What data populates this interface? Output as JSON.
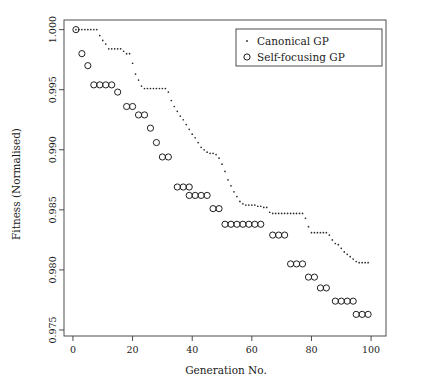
{
  "figure": {
    "width": 421,
    "height": 391,
    "background": "#ffffff",
    "foreground": "#1a1a1a"
  },
  "chart_data": {
    "type": "scatter",
    "title": "",
    "xlabel": "Generation No.",
    "ylabel": "Fitness (Normalised)",
    "xlim": [
      -3,
      105
    ],
    "ylim": [
      0.9745,
      1.0008
    ],
    "xticks": [
      0,
      20,
      40,
      60,
      80,
      100
    ],
    "xticklabels": [
      "0",
      "20",
      "40",
      "60",
      "80",
      "100"
    ],
    "yticks": [
      0.975,
      0.98,
      0.985,
      0.99,
      0.995,
      1.0
    ],
    "yticklabels": [
      "0.975",
      "0.980",
      "0.985",
      "0.990",
      "0.995",
      "1.000"
    ],
    "grid": false,
    "legend_position": "top-right",
    "series": [
      {
        "name": "Canonical GP",
        "marker": "dot",
        "color": "#2b2b2b",
        "points": [
          [
            1,
            1.0
          ],
          [
            2,
            1.0
          ],
          [
            3,
            1.0
          ],
          [
            4,
            1.0
          ],
          [
            5,
            1.0
          ],
          [
            6,
            1.0
          ],
          [
            7,
            1.0
          ],
          [
            8,
            1.0
          ],
          [
            9,
            0.9995
          ],
          [
            10,
            0.9991
          ],
          [
            11,
            0.9988
          ],
          [
            12,
            0.9984
          ],
          [
            13,
            0.9984
          ],
          [
            14,
            0.9984
          ],
          [
            15,
            0.9984
          ],
          [
            16,
            0.9984
          ],
          [
            17,
            0.9982
          ],
          [
            18,
            0.998
          ],
          [
            19,
            0.998
          ],
          [
            20,
            0.9972
          ],
          [
            21,
            0.9963
          ],
          [
            22,
            0.9958
          ],
          [
            23,
            0.9953
          ],
          [
            24,
            0.9951
          ],
          [
            25,
            0.9951
          ],
          [
            26,
            0.9951
          ],
          [
            27,
            0.9951
          ],
          [
            28,
            0.9951
          ],
          [
            29,
            0.9951
          ],
          [
            30,
            0.9951
          ],
          [
            31,
            0.9951
          ],
          [
            32,
            0.9948
          ],
          [
            33,
            0.9941
          ],
          [
            34,
            0.9936
          ],
          [
            35,
            0.9932
          ],
          [
            36,
            0.9928
          ],
          [
            37,
            0.9925
          ],
          [
            38,
            0.9921
          ],
          [
            39,
            0.9917
          ],
          [
            40,
            0.9913
          ],
          [
            41,
            0.991
          ],
          [
            42,
            0.9906
          ],
          [
            43,
            0.9902
          ],
          [
            44,
            0.99
          ],
          [
            45,
            0.9898
          ],
          [
            46,
            0.9897
          ],
          [
            47,
            0.9897
          ],
          [
            48,
            0.9896
          ],
          [
            49,
            0.9893
          ],
          [
            50,
            0.9888
          ],
          [
            51,
            0.9882
          ],
          [
            52,
            0.9875
          ],
          [
            53,
            0.987
          ],
          [
            54,
            0.9865
          ],
          [
            55,
            0.9861
          ],
          [
            56,
            0.9857
          ],
          [
            57,
            0.9855
          ],
          [
            58,
            0.9854
          ],
          [
            59,
            0.9854
          ],
          [
            60,
            0.9854
          ],
          [
            61,
            0.9854
          ],
          [
            62,
            0.9853
          ],
          [
            63,
            0.9853
          ],
          [
            64,
            0.9852
          ],
          [
            65,
            0.9852
          ],
          [
            66,
            0.9848
          ],
          [
            67,
            0.9847
          ],
          [
            68,
            0.9847
          ],
          [
            69,
            0.9847
          ],
          [
            70,
            0.9847
          ],
          [
            71,
            0.9847
          ],
          [
            72,
            0.9847
          ],
          [
            73,
            0.9847
          ],
          [
            74,
            0.9847
          ],
          [
            75,
            0.9847
          ],
          [
            76,
            0.9847
          ],
          [
            77,
            0.9847
          ],
          [
            78,
            0.9843
          ],
          [
            79,
            0.9836
          ],
          [
            80,
            0.9831
          ],
          [
            81,
            0.9831
          ],
          [
            82,
            0.9831
          ],
          [
            83,
            0.9831
          ],
          [
            84,
            0.9831
          ],
          [
            85,
            0.9831
          ],
          [
            86,
            0.9829
          ],
          [
            87,
            0.9825
          ],
          [
            88,
            0.9822
          ],
          [
            89,
            0.9821
          ],
          [
            90,
            0.9818
          ],
          [
            91,
            0.9815
          ],
          [
            92,
            0.9813
          ],
          [
            93,
            0.9811
          ],
          [
            94,
            0.9809
          ],
          [
            95,
            0.9807
          ],
          [
            96,
            0.9806
          ],
          [
            97,
            0.9806
          ],
          [
            98,
            0.9806
          ],
          [
            99,
            0.9806
          ]
        ]
      },
      {
        "name": "Self-focusing GP",
        "marker": "circle",
        "color": "#1f1f1f",
        "points": [
          [
            1,
            1.0
          ],
          [
            3,
            0.998
          ],
          [
            5,
            0.997
          ],
          [
            7,
            0.9954
          ],
          [
            9,
            0.9954
          ],
          [
            11,
            0.9954
          ],
          [
            13,
            0.9954
          ],
          [
            15,
            0.9948
          ],
          [
            18,
            0.9936
          ],
          [
            20,
            0.9936
          ],
          [
            22,
            0.9929
          ],
          [
            24,
            0.9929
          ],
          [
            26,
            0.9918
          ],
          [
            28,
            0.9906
          ],
          [
            30,
            0.9894
          ],
          [
            32,
            0.9894
          ],
          [
            35,
            0.9869
          ],
          [
            37,
            0.9869
          ],
          [
            39,
            0.9869
          ],
          [
            39,
            0.9862
          ],
          [
            41,
            0.9862
          ],
          [
            43,
            0.9862
          ],
          [
            45,
            0.9862
          ],
          [
            47,
            0.9851
          ],
          [
            49,
            0.9851
          ],
          [
            51,
            0.9838
          ],
          [
            53,
            0.9838
          ],
          [
            55,
            0.9838
          ],
          [
            57,
            0.9838
          ],
          [
            59,
            0.9838
          ],
          [
            61,
            0.9838
          ],
          [
            63,
            0.9838
          ],
          [
            67,
            0.9829
          ],
          [
            69,
            0.9829
          ],
          [
            71,
            0.9829
          ],
          [
            73,
            0.9805
          ],
          [
            75,
            0.9805
          ],
          [
            77,
            0.9805
          ],
          [
            79,
            0.9794
          ],
          [
            81,
            0.9794
          ],
          [
            83,
            0.9785
          ],
          [
            85,
            0.9785
          ],
          [
            88,
            0.9774
          ],
          [
            90,
            0.9774
          ],
          [
            92,
            0.9774
          ],
          [
            94,
            0.9774
          ],
          [
            95,
            0.9763
          ],
          [
            97,
            0.9763
          ],
          [
            99,
            0.9763
          ]
        ]
      }
    ]
  },
  "legend": {
    "entries": [
      {
        "label": "Canonical GP",
        "marker": "dot"
      },
      {
        "label": "Self-focusing GP",
        "marker": "circle"
      }
    ]
  }
}
